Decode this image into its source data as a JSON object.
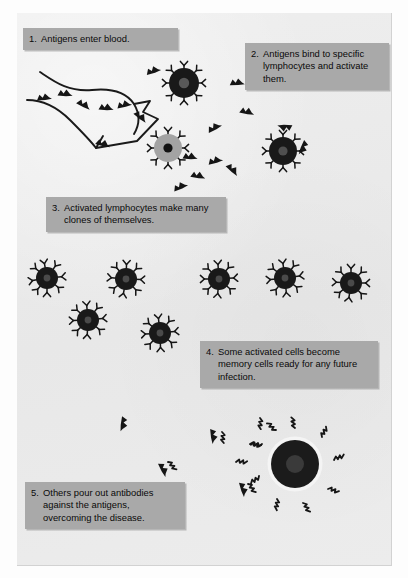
{
  "figure": {
    "background_color": "#ebebeb",
    "page_color": "#fdfdfd",
    "caption_box_color": "#a9a9a9",
    "ink_color": "#111111",
    "cell_dark_color": "#1c1c1c",
    "cell_gray_color": "#a3a3a3"
  },
  "captions": [
    {
      "number": "1.",
      "text": "Antigens enter blood.",
      "lines": [
        "Antigens enter blood."
      ]
    },
    {
      "number": "2.",
      "text": "Antigens bind to specific lymphocytes and activate them.",
      "lines": [
        "Antigens bind to specific",
        "lymphocytes and activate",
        "them."
      ]
    },
    {
      "number": "3.",
      "text": "Activated lymphocytes make many clones of themselves.",
      "lines": [
        "Activated lymphocytes make",
        "many clones of themselves."
      ]
    },
    {
      "number": "4.",
      "text": "Some activated cells become memory cells ready for any future infection.",
      "lines": [
        "Some activated cells become",
        "memory cells ready for any",
        "future infection."
      ]
    },
    {
      "number": "5.",
      "text": "Others pour out antibodies against the antigens, overcoming the disease.",
      "lines": [
        "Others pour out antibodies",
        "against the antigens,",
        "overcoming the disease."
      ]
    }
  ],
  "elements": {
    "blood_vessel": {
      "name": "blood-vessel-outline",
      "description": "Outlined curved blood vessel with funnel opening at lower right"
    },
    "antigens": {
      "name": "antigen",
      "glyph": "dark double-peak mountain shape",
      "count_free": 17,
      "positions": [
        [
          44,
          97
        ],
        [
          63,
          94
        ],
        [
          82,
          103
        ],
        [
          104,
          107
        ],
        [
          120,
          105
        ],
        [
          140,
          113
        ],
        [
          153,
          70
        ],
        [
          236,
          82
        ],
        [
          247,
          110
        ],
        [
          190,
          155
        ],
        [
          215,
          160
        ],
        [
          198,
          173
        ],
        [
          180,
          185
        ],
        [
          232,
          168
        ],
        [
          103,
          143
        ],
        [
          123,
          450
        ],
        [
          210,
          437
        ]
      ]
    },
    "lymphocytes": [
      {
        "name": "lymphocyte-activated-top",
        "cx": 184,
        "cy": 83,
        "r": 15,
        "fill": "dark",
        "nucleus_r": 5,
        "receptor_count": 8,
        "receptor_style": "Y",
        "bound_antigens": 0
      },
      {
        "name": "lymphocyte-inactive-gray",
        "cx": 168,
        "cy": 148,
        "r": 14,
        "fill": "gray",
        "nucleus_r": 4.5,
        "receptor_count": 8,
        "receptor_style": "Y",
        "bound_antigens": 0
      },
      {
        "name": "lymphocyte-antigen-bound",
        "cx": 283,
        "cy": 151,
        "r": 14,
        "fill": "dark",
        "nucleus_r": 4.5,
        "receptor_count": 8,
        "receptor_style": "Y",
        "bound_antigens": 2
      }
    ],
    "clone_cells": {
      "name": "clone-lymphocyte",
      "count": 7,
      "radius": 11,
      "positions": [
        [
          47,
          278
        ],
        [
          126,
          279
        ],
        [
          219,
          279
        ],
        [
          285,
          278
        ],
        [
          351,
          283
        ],
        [
          88,
          320
        ],
        [
          160,
          333
        ]
      ]
    },
    "plasma_cell": {
      "name": "plasma-cell",
      "cx": 295,
      "cy": 464,
      "r": 24,
      "nucleus_r": 9,
      "antibody_count": 9,
      "halo": true
    },
    "antibodies": {
      "name": "antibody",
      "glyph": "zigzag lightning stroke",
      "free_positions": [
        [
          133,
          451
        ],
        [
          175,
          447
        ],
        [
          229,
          434
        ],
        [
          250,
          447
        ],
        [
          236,
          465
        ],
        [
          244,
          490
        ]
      ]
    }
  }
}
